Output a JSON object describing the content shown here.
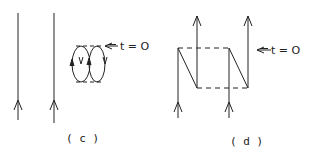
{
  "panels": [
    {
      "id": "c",
      "caption": "( c )",
      "annotation": "t = O",
      "elements": [
        "two upward fermion lines",
        "closed bubble loop with opposing arrows",
        "dashed interaction lines at top and bottom of loop"
      ]
    },
    {
      "id": "d",
      "caption": "( d )",
      "annotation": "t = O",
      "elements": [
        "two zig-zag fermion lines (N shapes)",
        "dashed interaction lines connecting them",
        "upward arrows at bottom and top"
      ]
    }
  ],
  "colors": {
    "line": "#222222",
    "background": "#ffffff"
  }
}
